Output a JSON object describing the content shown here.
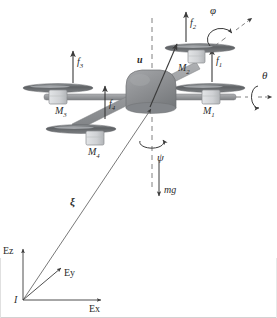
{
  "figure": {
    "background": "#ffffff",
    "border_color": "#cfcfcf",
    "body_fill": "#8f9194",
    "body_stroke": "#6e7073",
    "disc_fill": "#6f7275",
    "disc_highlight": "#b9bcbf",
    "motor_fill": "#d6d8da",
    "motor_stroke": "#8a8c8f",
    "arm_fill": "#9a9c9f",
    "line_color": "#5a5a5a",
    "dash_color": "#7a7a7a"
  },
  "rotors": [
    {
      "id": "rotor-1",
      "motor_label": "M",
      "motor_sub": "1",
      "force_label": "f",
      "force_sub": "1",
      "position": "right"
    },
    {
      "id": "rotor-2",
      "motor_label": "M",
      "motor_sub": "2",
      "force_label": "f",
      "force_sub": "2",
      "position": "upper-right"
    },
    {
      "id": "rotor-3",
      "motor_label": "M",
      "motor_sub": "3",
      "force_label": "f",
      "force_sub": "3",
      "position": "left"
    },
    {
      "id": "rotor-4",
      "motor_label": "M",
      "motor_sub": "4",
      "force_label": "f",
      "force_sub": "4",
      "position": "lower-left"
    }
  ],
  "labels": {
    "m1": "M",
    "m1_sub": "1",
    "m2": "M",
    "m2_sub": "2",
    "m3": "M",
    "m3_sub": "3",
    "m4": "M",
    "m4_sub": "4",
    "f1": "f",
    "f1_sub": "1",
    "f2": "f",
    "f2_sub": "2",
    "f3": "f",
    "f3_sub": "3",
    "f4": "f",
    "f4_sub": "4",
    "thrust": "u",
    "weight": "mg",
    "position_vector": "ξ",
    "roll": "φ",
    "pitch": "θ",
    "yaw": "ψ",
    "frame_origin": "I",
    "axis_x": "Ex",
    "axis_y": "Ey",
    "axis_z": "Ez"
  },
  "annotations": {
    "thrust_description": "Total thrust vector u along body z-axis",
    "weight_description": "Gravitational force mg acting downward",
    "position_description": "Position vector ξ from inertial origin I to vehicle centre of mass",
    "roll_description": "Roll rotation φ about body x-axis",
    "pitch_description": "Pitch rotation θ about body y-axis",
    "yaw_description": "Yaw rotation ψ about body z-axis"
  }
}
